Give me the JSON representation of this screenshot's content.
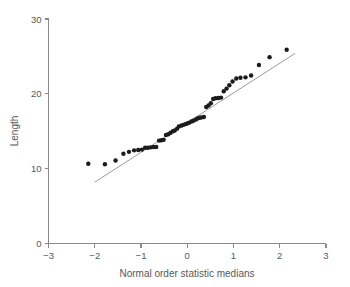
{
  "chart_data": {
    "type": "scatter",
    "title": "",
    "xlabel": "Normal order statistic medians",
    "ylabel": "Length",
    "xlim": [
      -3,
      3
    ],
    "ylim": [
      0,
      30
    ],
    "xticks": [
      -3,
      -2,
      -1,
      0,
      1,
      2,
      3
    ],
    "xticklabels": [
      "−3",
      "−2",
      "−1",
      "0",
      "1",
      "2",
      "3"
    ],
    "yticks": [
      0,
      10,
      20,
      30
    ],
    "yticklabels": [
      "0",
      "10",
      "20",
      "30"
    ],
    "grid": false,
    "legend": null,
    "series": [
      {
        "name": "Normal order statistic medians vs Length",
        "marker": "filled-circle",
        "color": "#1b1b1b",
        "points": [
          [
            -2.14,
            10.65
          ],
          [
            -1.78,
            10.6
          ],
          [
            -1.55,
            11.1
          ],
          [
            -1.38,
            12.0
          ],
          [
            -1.26,
            12.25
          ],
          [
            -1.15,
            12.45
          ],
          [
            -1.06,
            12.5
          ],
          [
            -0.98,
            12.55
          ],
          [
            -0.91,
            12.8
          ],
          [
            -0.85,
            12.8
          ],
          [
            -0.79,
            12.85
          ],
          [
            -0.73,
            12.9
          ],
          [
            -0.67,
            12.9
          ],
          [
            -0.61,
            13.75
          ],
          [
            -0.56,
            13.8
          ],
          [
            -0.51,
            13.85
          ],
          [
            -0.46,
            14.5
          ],
          [
            -0.41,
            14.6
          ],
          [
            -0.36,
            14.8
          ],
          [
            -0.31,
            15.0
          ],
          [
            -0.27,
            15.1
          ],
          [
            -0.22,
            15.35
          ],
          [
            -0.18,
            15.65
          ],
          [
            -0.13,
            15.75
          ],
          [
            -0.09,
            15.85
          ],
          [
            -0.04,
            15.95
          ],
          [
            0.0,
            16.05
          ],
          [
            0.04,
            16.15
          ],
          [
            0.09,
            16.3
          ],
          [
            0.13,
            16.4
          ],
          [
            0.18,
            16.55
          ],
          [
            0.22,
            16.7
          ],
          [
            0.27,
            16.8
          ],
          [
            0.31,
            16.85
          ],
          [
            0.36,
            16.9
          ],
          [
            0.41,
            18.25
          ],
          [
            0.46,
            18.45
          ],
          [
            0.51,
            18.75
          ],
          [
            0.56,
            19.3
          ],
          [
            0.61,
            19.4
          ],
          [
            0.67,
            19.45
          ],
          [
            0.73,
            19.5
          ],
          [
            0.79,
            20.35
          ],
          [
            0.85,
            20.7
          ],
          [
            0.91,
            21.15
          ],
          [
            0.98,
            21.65
          ],
          [
            1.06,
            22.05
          ],
          [
            1.15,
            22.15
          ],
          [
            1.26,
            22.2
          ],
          [
            1.38,
            22.45
          ],
          [
            1.55,
            23.85
          ],
          [
            1.78,
            24.9
          ],
          [
            2.15,
            25.9
          ]
        ]
      }
    ],
    "reference_line": {
      "name": "fitted-reference-line",
      "color": "#9b9b9d",
      "x": [
        -2.0,
        2.33
      ],
      "y": [
        8.2,
        25.4
      ]
    }
  },
  "axes": {
    "x_axis_label": "Normal order statistic medians",
    "y_axis_label": "Length"
  }
}
